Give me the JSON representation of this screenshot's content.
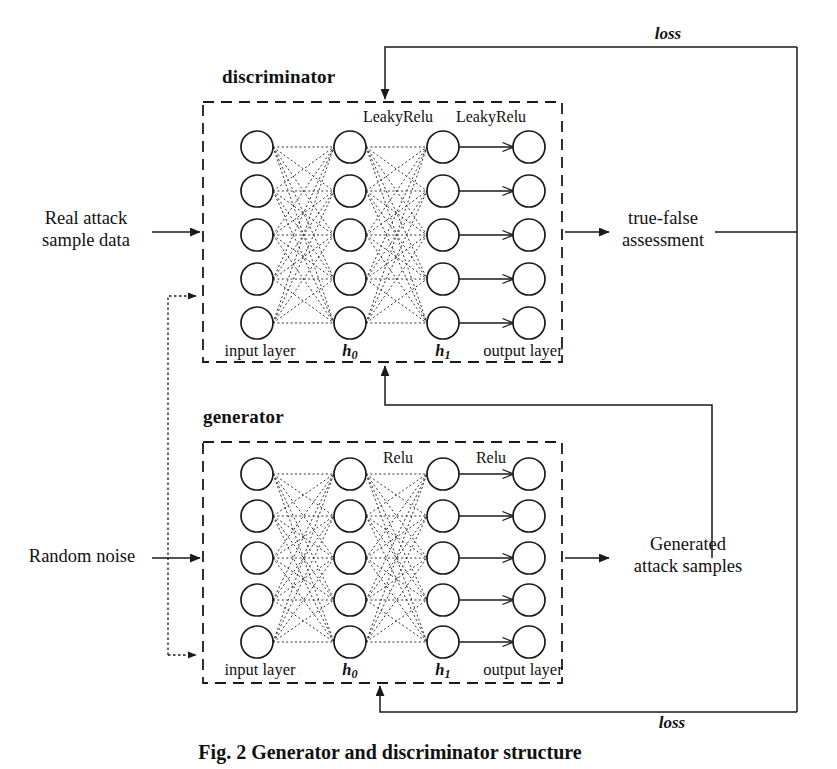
{
  "figure": {
    "caption": "Fig. 2  Generator and discriminator structure",
    "background_color": "#ffffff",
    "stroke_color": "#1a1a1a"
  },
  "modules": [
    {
      "id": "discriminator",
      "title": "discriminator",
      "activation_labels": [
        "LeakyRelu",
        "LeakyRelu"
      ],
      "layer_labels": [
        "input layer",
        "h",
        "h",
        "output layer"
      ],
      "layer_subscripts": [
        "",
        "0",
        "1",
        ""
      ],
      "nodes_per_layer": 5,
      "layer_count": 4
    },
    {
      "id": "generator",
      "title": "generator",
      "activation_labels": [
        "Relu",
        "Relu"
      ],
      "layer_labels": [
        "input layer",
        "h",
        "h",
        "output layer"
      ],
      "layer_subscripts": [
        "",
        "0",
        "1",
        ""
      ],
      "nodes_per_layer": 5,
      "layer_count": 4
    }
  ],
  "io_labels": {
    "real_input": "Real attack\nsample data",
    "noise_input": "Random noise",
    "discriminator_output": "true-false\nassessment",
    "generator_output": "Generated\nattack samples"
  },
  "feedback_labels": {
    "top_loss": "loss",
    "bottom_loss": "loss"
  },
  "chart_data": {
    "type": "diagram",
    "title": "Generator and discriminator structure",
    "nodes": [
      {
        "id": "real-attack-sample-data",
        "label": "Real attack sample data",
        "kind": "io-input"
      },
      {
        "id": "random-noise",
        "label": "Random noise",
        "kind": "io-input"
      },
      {
        "id": "discriminator",
        "label": "discriminator",
        "kind": "module"
      },
      {
        "id": "generator",
        "label": "generator",
        "kind": "module"
      },
      {
        "id": "true-false-assessment",
        "label": "true-false assessment",
        "kind": "io-output"
      },
      {
        "id": "generated-attack-samples",
        "label": "Generated attack samples",
        "kind": "io-output"
      }
    ],
    "edges": [
      {
        "from": "real-attack-sample-data",
        "to": "discriminator",
        "style": "solid",
        "label": ""
      },
      {
        "from": "random-noise",
        "to": "generator",
        "style": "solid",
        "label": ""
      },
      {
        "from": "discriminator",
        "to": "true-false-assessment",
        "style": "solid",
        "label": ""
      },
      {
        "from": "generator",
        "to": "generated-attack-samples",
        "style": "solid",
        "label": ""
      },
      {
        "from": "generated-attack-samples",
        "to": "discriminator",
        "style": "solid",
        "label": ""
      },
      {
        "from": "true-false-assessment",
        "to": "discriminator",
        "style": "solid",
        "label": "loss"
      },
      {
        "from": "true-false-assessment",
        "to": "generator",
        "style": "solid",
        "label": "loss"
      },
      {
        "from": "generator",
        "to": "discriminator",
        "style": "dotted",
        "label": ""
      }
    ]
  }
}
